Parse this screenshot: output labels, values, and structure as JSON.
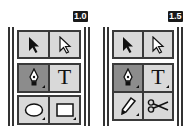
{
  "panels": [
    {
      "version_badge": "1.0",
      "tools": [
        {
          "name": "selection-tool",
          "icon": "arrow-solid-icon"
        },
        {
          "name": "direct-selection-tool",
          "icon": "arrow-hollow-icon"
        },
        {
          "name": "pen-tool",
          "icon": "pen-nib-icon",
          "selected": true,
          "has_flyout": true
        },
        {
          "name": "type-tool",
          "icon": "type-icon",
          "label": "T"
        },
        {
          "name": "ellipse-tool",
          "icon": "ellipse-icon",
          "has_flyout": true
        },
        {
          "name": "rectangle-tool",
          "icon": "rectangle-icon",
          "has_flyout": true
        }
      ]
    },
    {
      "version_badge": "1.5",
      "tools": [
        {
          "name": "selection-tool",
          "icon": "arrow-solid-icon"
        },
        {
          "name": "direct-selection-tool",
          "icon": "arrow-hollow-icon"
        },
        {
          "name": "pen-tool",
          "icon": "pen-nib-icon",
          "selected": true,
          "has_flyout": true
        },
        {
          "name": "type-tool",
          "icon": "type-icon",
          "label": "T",
          "has_flyout": true
        },
        {
          "name": "pencil-tool",
          "icon": "pencil-icon",
          "has_flyout": true
        },
        {
          "name": "scissors-tool",
          "icon": "scissors-icon"
        }
      ]
    }
  ],
  "colors": {
    "cell_bg": "#d9d9d9",
    "selected_bg": "#8c8c8c",
    "border": "#3a3a3a",
    "badge_bg": "#1a1a1a"
  }
}
